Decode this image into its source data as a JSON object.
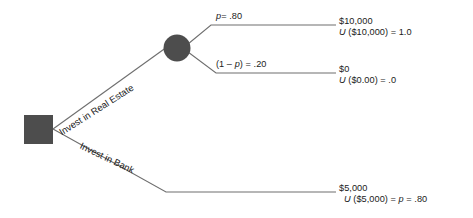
{
  "diagram": {
    "type": "decision-tree",
    "title": "",
    "nodes": {
      "decision_node": {
        "shape": "square",
        "color": "#4d4d4d"
      },
      "chance_node": {
        "shape": "circle",
        "color": "#4d4d4d"
      }
    },
    "branches": [
      {
        "id": "real-estate",
        "label": "Invest in Real Estate",
        "from": "decision_node",
        "to": "chance_node"
      },
      {
        "id": "bank",
        "label": "Invest in Bank",
        "from": "decision_node",
        "to": "outcome-3"
      }
    ],
    "probabilities": {
      "upper": {
        "symbol": "p",
        "equals": "= .80",
        "value": 0.8
      },
      "lower": {
        "prefix": "(1 – ",
        "symbol": "p",
        "suffix": ") = .20",
        "value": 0.2
      }
    },
    "outcomes": [
      {
        "id": "outcome-1",
        "amount": "$10,000",
        "utility_fn": "U",
        "utility_arg": " ($10,000) = 1.0",
        "utility_value": 1.0
      },
      {
        "id": "outcome-2",
        "amount": "$0",
        "utility_fn": "U",
        "utility_arg": " ($0.00) = .0",
        "utility_value": 0.0
      },
      {
        "id": "outcome-3",
        "amount": "$5,000",
        "utility_fn": "U",
        "utility_arg_pre": " ($5,000) = ",
        "utility_symbol": "p",
        "utility_arg_post": " = .80",
        "utility_value": 0.8
      }
    ]
  }
}
